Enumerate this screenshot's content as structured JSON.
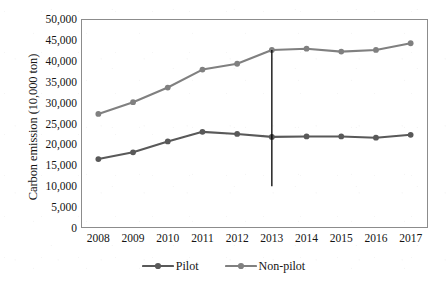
{
  "chart_data": {
    "type": "line",
    "title": "",
    "xlabel": "",
    "ylabel": "Carbon emission (10,000 ton)",
    "categories": [
      "2008",
      "2009",
      "2010",
      "2011",
      "2012",
      "2013",
      "2014",
      "2015",
      "2016",
      "2017"
    ],
    "x": [
      2008,
      2009,
      2010,
      2011,
      2012,
      2013,
      2014,
      2015,
      2016,
      2017
    ],
    "series": [
      {
        "name": "Pilot",
        "color": "#595959",
        "marker": "circle",
        "values": [
          16500,
          18100,
          20700,
          23000,
          22500,
          21800,
          21900,
          21900,
          21600,
          22300
        ]
      },
      {
        "name": "Non-pilot",
        "color": "#808080",
        "marker": "circle",
        "values": [
          27300,
          30100,
          33600,
          37900,
          39300,
          42600,
          42900,
          42200,
          42600,
          44200
        ]
      }
    ],
    "ylim": [
      0,
      50000
    ],
    "ytick_values": [
      0,
      5000,
      10000,
      15000,
      20000,
      25000,
      30000,
      35000,
      40000,
      45000,
      50000
    ],
    "ytick_labels": [
      "0",
      "5,000",
      "10,000",
      "15,000",
      "20,000",
      "25,000",
      "30,000",
      "35,000",
      "40,000",
      "45,000",
      "50,000"
    ],
    "grid": false,
    "legend_position": "bottom",
    "annotations": [
      {
        "type": "vertical-reference-line",
        "name": "policy-year-marker",
        "x": 2013,
        "y_top": 42600,
        "y_bottom": 10000,
        "color": "#000000"
      }
    ]
  },
  "legend": {
    "entries": [
      {
        "label": "Pilot",
        "color": "#595959"
      },
      {
        "label": "Non-pilot",
        "color": "#808080"
      }
    ]
  },
  "axes": {
    "y_title": "Carbon emission (10,000 ton)",
    "frame_color": "#8c8c8c"
  }
}
